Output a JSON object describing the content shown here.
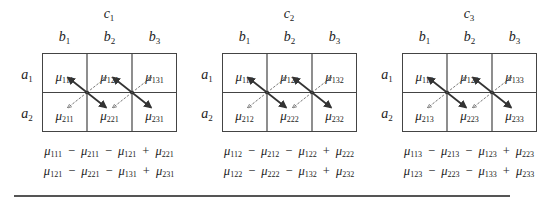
{
  "figure": {
    "row_factor_labels": [
      {
        "name": "a",
        "sub": "1"
      },
      {
        "name": "a",
        "sub": "2"
      }
    ],
    "column_factor_labels": [
      {
        "name": "b",
        "sub": "1"
      },
      {
        "name": "b",
        "sub": "2"
      },
      {
        "name": "b",
        "sub": "3"
      }
    ],
    "panels": [
      {
        "title": {
          "name": "c",
          "sub": "1"
        },
        "cells": [
          [
            "111",
            "121",
            "131"
          ],
          [
            "211",
            "221",
            "231"
          ]
        ],
        "contrasts": [
          [
            "111",
            "211",
            "121",
            "221"
          ],
          [
            "121",
            "221",
            "131",
            "231"
          ]
        ]
      },
      {
        "title": {
          "name": "c",
          "sub": "2"
        },
        "cells": [
          [
            "112",
            "122",
            "132"
          ],
          [
            "212",
            "222",
            "232"
          ]
        ],
        "contrasts": [
          [
            "112",
            "212",
            "122",
            "222"
          ],
          [
            "122",
            "222",
            "132",
            "232"
          ]
        ]
      },
      {
        "title": {
          "name": "c",
          "sub": "3"
        },
        "cells": [
          [
            "113",
            "123",
            "133"
          ],
          [
            "213",
            "223",
            "233"
          ]
        ],
        "contrasts": [
          [
            "113",
            "213",
            "123",
            "223"
          ],
          [
            "123",
            "223",
            "133",
            "233"
          ]
        ]
      }
    ],
    "symbol": "μ",
    "operators": [
      "−",
      "−",
      "+"
    ],
    "arrow_legend": {
      "solid": "main diagonal (positive terms, heavy arrows)",
      "dashed": "off diagonal (negative terms, light dashed arrows)"
    },
    "colors": {
      "line": "#444444",
      "text": "#222222",
      "solid_arrow": "#333333",
      "dashed_arrow": "#666666"
    }
  }
}
